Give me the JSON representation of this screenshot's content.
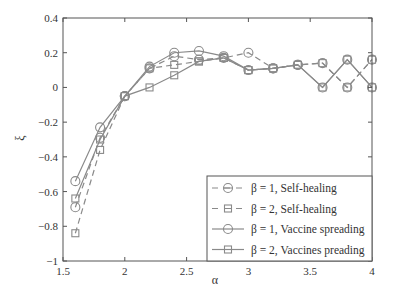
{
  "chart_data": {
    "type": "line",
    "title": "",
    "xlabel": "α",
    "ylabel": "ξ",
    "xlim": [
      1.5,
      4
    ],
    "ylim": [
      -1,
      0.4
    ],
    "xticks": [
      1.5,
      2,
      2.5,
      3,
      3.5,
      4
    ],
    "xtick_labels": [
      "1.5",
      "2",
      "2.5",
      "3",
      "3.5",
      "4"
    ],
    "yticks": [
      -1,
      -0.8,
      -0.6,
      -0.4,
      -0.2,
      0,
      0.2,
      0.4
    ],
    "ytick_labels": [
      "−1",
      "−0.8",
      "−0.6",
      "−0.4",
      "−0.2",
      "0",
      "0.2",
      "0.4"
    ],
    "grid": false,
    "legend_position": "lower right",
    "x": [
      1.6,
      1.8,
      2.0,
      2.2,
      2.4,
      2.6,
      2.8,
      3.0,
      3.2,
      3.4,
      3.6,
      3.8,
      4.0
    ],
    "series": [
      {
        "name": "β = 1, Self-healing",
        "line": "dashed",
        "marker": "circle",
        "values": [
          -0.69,
          -0.29,
          -0.05,
          0.11,
          0.18,
          0.16,
          0.17,
          0.2,
          0.11,
          0.13,
          0.14,
          0.0,
          0.16
        ]
      },
      {
        "name": "β = 2, Self-healing",
        "line": "dashed",
        "marker": "square",
        "values": [
          -0.84,
          -0.36,
          -0.05,
          0.11,
          0.13,
          0.15,
          0.17,
          0.1,
          0.11,
          0.13,
          0.14,
          0.0,
          0.16
        ]
      },
      {
        "name": "β = 1, Vaccine spreading",
        "line": "solid",
        "marker": "circle",
        "values": [
          -0.54,
          -0.23,
          -0.05,
          0.12,
          0.2,
          0.21,
          0.18,
          0.1,
          0.11,
          0.13,
          0.0,
          0.16,
          0.0
        ]
      },
      {
        "name": "β = 2, Vaccines preading",
        "line": "solid",
        "marker": "square",
        "values": [
          -0.64,
          -0.3,
          -0.05,
          0.0,
          0.07,
          0.15,
          0.17,
          0.1,
          0.11,
          0.13,
          0.0,
          0.16,
          0.0
        ]
      }
    ],
    "colors": {
      "line": "#8a8a8a",
      "axis": "#555555",
      "text": "#333333"
    }
  }
}
